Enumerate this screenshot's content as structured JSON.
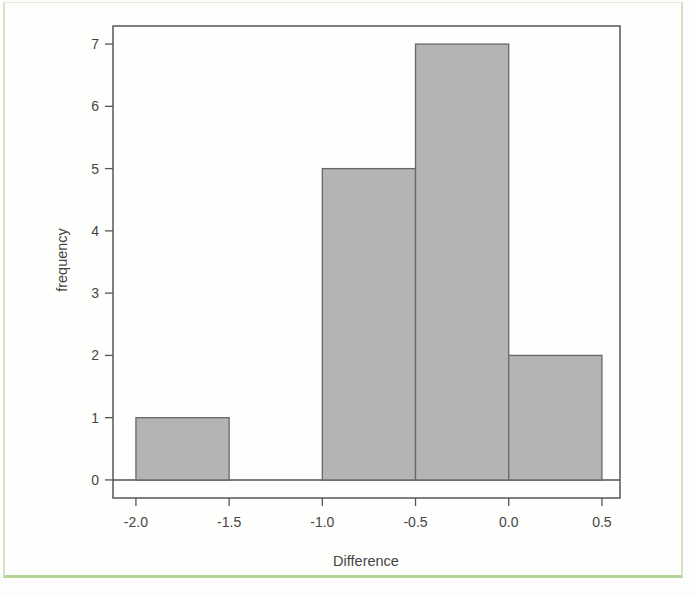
{
  "figure": {
    "kind": "scanned-histogram-figure",
    "background": "#fefefd",
    "frame_border_color": "#b5d596"
  },
  "chart_data": {
    "type": "bar",
    "subtype": "histogram",
    "title": "",
    "xlabel": "Difference",
    "ylabel": "frequency",
    "bins": [
      {
        "range": [
          -2.0,
          -1.5
        ],
        "count": 1
      },
      {
        "range": [
          -1.5,
          -1.0
        ],
        "count": 0
      },
      {
        "range": [
          -1.0,
          -0.5
        ],
        "count": 5
      },
      {
        "range": [
          -0.5,
          0.0
        ],
        "count": 7
      },
      {
        "range": [
          0.0,
          0.5
        ],
        "count": 2
      }
    ],
    "x_tick_values": [
      -2.0,
      -1.5,
      -1.0,
      -0.5,
      0.0,
      0.5
    ],
    "x_tick_labels": [
      "-2.0",
      "-1.5",
      "-1.0",
      "-0.5",
      "0.0",
      "0.5"
    ],
    "y_tick_values": [
      0,
      1,
      2,
      3,
      4,
      5,
      6,
      7
    ],
    "y_tick_labels": [
      "0",
      "1",
      "2",
      "3",
      "4",
      "5",
      "6",
      "7"
    ],
    "xlim": [
      -2.123,
      0.597
    ],
    "ylim": [
      -0.29,
      7.29
    ],
    "zero_baseline": true,
    "grid": false,
    "legend": null,
    "colors": {
      "bar_fill": "#b4b4b6",
      "bar_border": "#67676a",
      "axis_box": "#54565a",
      "zero_line": "#4e5052",
      "tick": "#54565a",
      "text": "#454545"
    }
  }
}
